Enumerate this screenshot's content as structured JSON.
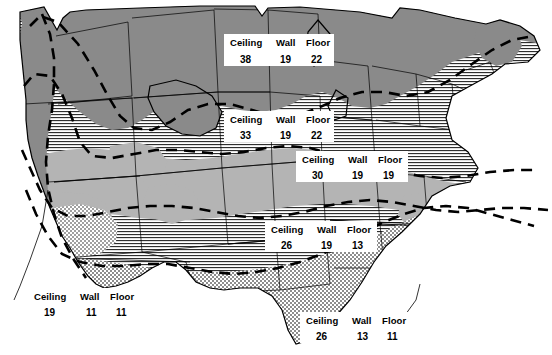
{
  "map": {
    "title": "Recommended Insulation R-Values by U.S. Climate Zone",
    "headers": {
      "ceiling": "Ceiling",
      "wall": "Wall",
      "floor": "Floor"
    },
    "colors": {
      "dark_gray": "#8a8a8a",
      "medium_gray": "#b4b4b4",
      "hatch_line": "#2b2b2b",
      "stipple": "#6e6e6e",
      "background": "#ffffff",
      "outline": "#000000"
    },
    "zones": [
      {
        "id": "zone-north",
        "fill": "dark-gray",
        "ceiling_label": "Ceiling",
        "ceiling": "38",
        "wall_label": "Wall",
        "wall": "19",
        "floor_label": "Floor",
        "floor": "22"
      },
      {
        "id": "zone-upper-middle",
        "fill": "horizontal-hatch",
        "ceiling_label": "Ceiling",
        "ceiling": "33",
        "wall_label": "Wall",
        "wall": "19",
        "floor_label": "Floor",
        "floor": "22"
      },
      {
        "id": "zone-middle",
        "fill": "medium-gray",
        "ceiling_label": "Ceiling",
        "ceiling": "30",
        "wall_label": "Wall",
        "wall": "19",
        "floor_label": "Floor",
        "floor": "19"
      },
      {
        "id": "zone-lower-middle",
        "fill": "horizontal-hatch",
        "ceiling_label": "Ceiling",
        "ceiling": "26",
        "wall_label": "Wall",
        "wall": "19",
        "floor_label": "Floor",
        "floor": "13"
      },
      {
        "id": "zone-pacific-coast",
        "fill": "dark-gray",
        "ceiling_label": "Ceiling",
        "ceiling": "19",
        "wall_label": "Wall",
        "wall": "11",
        "floor_label": "Floor",
        "floor": "11"
      },
      {
        "id": "zone-south",
        "fill": "stipple",
        "ceiling_label": "Ceiling",
        "ceiling": "26",
        "wall_label": "Wall",
        "wall": "13",
        "floor_label": "Floor",
        "floor": "11"
      }
    ]
  }
}
